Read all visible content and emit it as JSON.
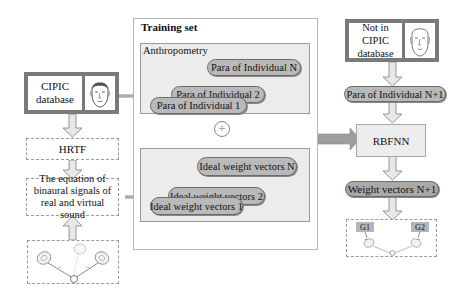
{
  "left": {
    "cipic_box": {
      "label_line1": "CIPIC",
      "label_line2": "database",
      "icon": "face-icon"
    },
    "hrtf": "HRTF",
    "equation": {
      "line1": "The equation of",
      "line2": "binaural signals of",
      "line3": "real and virtual sound"
    },
    "sound_scene_icon": "loudspeakers-and-head-icon"
  },
  "training_set": {
    "title": "Training set",
    "anthropometry": {
      "label": "Anthropometry",
      "items": [
        "Para of Individual N",
        "Para of Individual 2",
        "Para of Individual 1"
      ]
    },
    "plus_symbol": "+",
    "weights": {
      "items": [
        "Ideal weight vectors N",
        "Ideal weight vectors 2",
        "Ideal weight vectors 1"
      ]
    }
  },
  "right": {
    "not_in_cipic_box": {
      "label_line1": "Not in CIPIC",
      "label_line2": "database",
      "icon": "face-icon"
    },
    "para_new": "Para of Individual  N+1",
    "rbfnn": "RBFNN",
    "weight_new": "Weight vectors N+1",
    "output_scene": {
      "g1": "G1",
      "g2": "G2",
      "icon": "loudspeakers-and-head-icon"
    }
  },
  "colors": {
    "border_dark": "#7a7a7a",
    "pill_fill": "#b9b9b9",
    "panel_fill": "#ececec",
    "arrow_fill": "#e6e6e6",
    "arrow_stroke": "#8a8a8a"
  }
}
